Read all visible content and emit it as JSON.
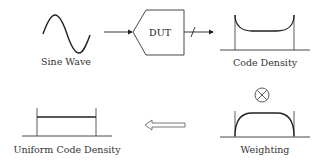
{
  "diagram": {
    "nodes": {
      "sine_wave": {
        "label": "Sine Wave"
      },
      "dut": {
        "label": "DUT"
      },
      "code_density": {
        "label": "Code Density"
      },
      "weighting": {
        "label": "Weighting",
        "operator": "⊗"
      },
      "uniform": {
        "label": "Uniform Code Density"
      }
    },
    "edges": [
      {
        "from": "sine_wave",
        "to": "dut",
        "style": "arrow"
      },
      {
        "from": "dut",
        "to": "code_density",
        "style": "bus-arrow"
      },
      {
        "from": "code_density",
        "to": "weighting",
        "style": "multiply"
      },
      {
        "from": "weighting",
        "to": "uniform",
        "style": "hollow-arrow"
      }
    ],
    "colors": {
      "stroke": "#222222",
      "text": "#333333",
      "background": "#ffffff"
    }
  }
}
